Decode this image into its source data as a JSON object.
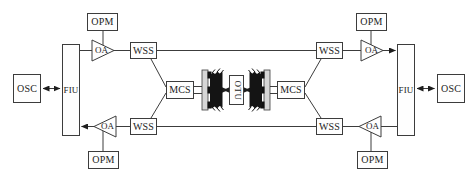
{
  "diagram": {
    "type": "optical-network-block-diagram",
    "colors": {
      "background": "#ffffff",
      "line": "#3c3c3c",
      "box_border": "#3c3c3c",
      "box_fill": "#fefefe",
      "arrowhead": "#1e1e1e",
      "fiber_brush": "#141414",
      "connector_plate": "#d6d6d6",
      "connector_pin": "#101010",
      "text": "#1b1b1b"
    },
    "nodes": {
      "osc_l": {
        "label": "OSC"
      },
      "fiu_l": {
        "label": "FIU"
      },
      "opm_tl": {
        "label": "OPM"
      },
      "oa_tl": {
        "label": "OA"
      },
      "wss_tl": {
        "label": "WSS"
      },
      "mcs_l": {
        "label": "MCS"
      },
      "otu": {
        "label": "OTU"
      },
      "mcs_r": {
        "label": "MCS"
      },
      "wss_tr": {
        "label": "WSS"
      },
      "oa_tr": {
        "label": "OA"
      },
      "opm_tr": {
        "label": "OPM"
      },
      "fiu_r": {
        "label": "FIU"
      },
      "osc_r": {
        "label": "OSC"
      },
      "wss_bl": {
        "label": "WSS"
      },
      "oa_bl": {
        "label": "OA"
      },
      "opm_bl": {
        "label": "OPM"
      },
      "wss_br": {
        "label": "WSS"
      },
      "oa_br": {
        "label": "OA"
      },
      "opm_br": {
        "label": "OPM"
      }
    },
    "edges": [
      {
        "from": "osc_l",
        "to": "fiu_l",
        "style": "bidirectional-arrow"
      },
      {
        "from": "fiu_l",
        "to": "oa_tl",
        "style": "line"
      },
      {
        "from": "oa_tl",
        "to": "wss_tl",
        "style": "line"
      },
      {
        "from": "wss_tl",
        "to": "wss_tr",
        "style": "line"
      },
      {
        "from": "wss_tr",
        "to": "oa_tr",
        "style": "line"
      },
      {
        "from": "oa_tr",
        "to": "fiu_r",
        "style": "arrow"
      },
      {
        "from": "fiu_r",
        "to": "osc_r",
        "style": "bidirectional-arrow"
      },
      {
        "from": "fiu_r",
        "to": "oa_br",
        "style": "line"
      },
      {
        "from": "oa_br",
        "to": "wss_br",
        "style": "line"
      },
      {
        "from": "wss_br",
        "to": "wss_bl",
        "style": "line"
      },
      {
        "from": "wss_bl",
        "to": "oa_bl",
        "style": "line"
      },
      {
        "from": "oa_bl",
        "to": "fiu_l",
        "style": "arrow"
      },
      {
        "from": "opm_tl",
        "to": "oa_tl",
        "style": "line"
      },
      {
        "from": "opm_bl",
        "to": "oa_bl",
        "style": "line"
      },
      {
        "from": "opm_tr",
        "to": "oa_tr",
        "style": "line"
      },
      {
        "from": "opm_br",
        "to": "oa_br",
        "style": "line"
      },
      {
        "from": "wss_tl",
        "to": "mcs_l",
        "style": "diagonal-line"
      },
      {
        "from": "wss_bl",
        "to": "mcs_l",
        "style": "diagonal-line"
      },
      {
        "from": "mcs_l",
        "to": "fiber_bundle_left",
        "style": "double-line"
      },
      {
        "from": "fiber_bundle_left",
        "to": "otu",
        "style": "bidirectional-arrow"
      },
      {
        "from": "otu",
        "to": "fiber_bundle_right",
        "style": "bidirectional-arrow"
      },
      {
        "from": "fiber_bundle_right",
        "to": "mcs_r",
        "style": "double-line"
      },
      {
        "from": "wss_tr",
        "to": "mcs_r",
        "style": "diagonal-line"
      },
      {
        "from": "wss_br",
        "to": "mcs_r",
        "style": "diagonal-line"
      }
    ]
  }
}
